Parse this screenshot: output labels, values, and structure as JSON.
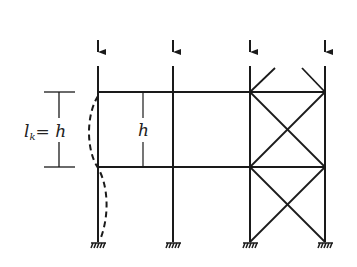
{
  "diagram": {
    "labels": {
      "buckling_length_main": "l",
      "buckling_length_sub": "k",
      "buckling_length_eq": "= h",
      "story_height": "h"
    },
    "columns_x": [
      98,
      173,
      250,
      325
    ],
    "beam_levels_y": [
      92,
      167
    ],
    "column_top_y": 66,
    "base_y": 242,
    "load_arrow": {
      "from_y": 40,
      "to_y": 60
    },
    "colors": {
      "line": "#1a1a1a",
      "background": "#ffffff"
    }
  }
}
